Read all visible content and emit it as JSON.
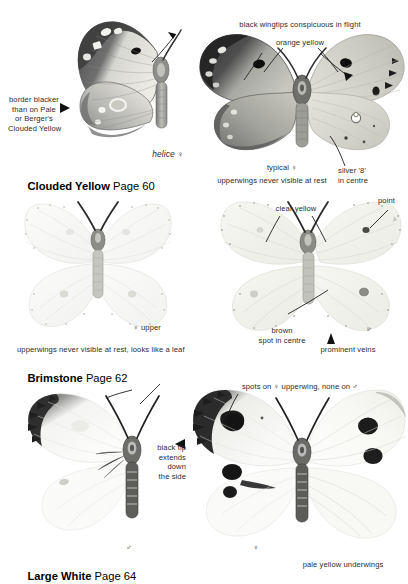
{
  "page": {
    "width": 408,
    "height": 584,
    "background": "#ffffff",
    "text_color": "#2b2b2b"
  },
  "sections": [
    {
      "id": "clouded-yellow",
      "title": "Clouded Yellow",
      "page_ref": "Page 60",
      "specimens": [
        {
          "id": "helice-female",
          "caption": "helice ♀",
          "style": "italic"
        },
        {
          "id": "typical-female",
          "caption": "typical ♀",
          "style": "normal"
        }
      ],
      "annotations": [
        {
          "id": "border-blacker",
          "text": "border blacker\nthan on Pale\nor Berger's\nClouded Yellow",
          "align": "center",
          "marker": "arrow-right"
        },
        {
          "id": "black-wingtips",
          "text": "black wingtips conspicuous in flight",
          "align": "center",
          "marker": "none"
        },
        {
          "id": "orange-yellow",
          "text": "orange yellow",
          "align": "center",
          "marker": "leader-v"
        },
        {
          "id": "upperwings-never-visible",
          "text": "upperwings never visible at rest",
          "align": "center",
          "marker": "none"
        },
        {
          "id": "silver-eight",
          "text": "silver '8'\nin centre",
          "align": "left",
          "marker": "leader-line"
        }
      ]
    },
    {
      "id": "brimstone",
      "title": "Brimstone",
      "page_ref": "Page 62",
      "specimens": [
        {
          "id": "female-upper",
          "caption": "♀ upper",
          "style": "normal"
        },
        {
          "id": "male",
          "caption": "♂",
          "style": "normal"
        }
      ],
      "annotations": [
        {
          "id": "clear-yellow",
          "text": "clear yellow",
          "align": "center",
          "marker": "leader-v"
        },
        {
          "id": "point",
          "text": "point",
          "align": "left",
          "marker": "leader-line"
        },
        {
          "id": "brown-spot",
          "text": "brown\nspot in centre",
          "align": "center",
          "marker": "leader-line"
        },
        {
          "id": "prominent-veins",
          "text": "prominent veins",
          "align": "center",
          "marker": "arrow-up"
        },
        {
          "id": "upperwings-leaf",
          "text": "upperwings never visible at rest, looks like a leaf",
          "align": "left",
          "marker": "none"
        }
      ]
    },
    {
      "id": "large-white",
      "title": "Large White",
      "page_ref": "Page 64",
      "specimens": [
        {
          "id": "male",
          "caption": "♂",
          "style": "normal"
        },
        {
          "id": "female",
          "caption": "♀",
          "style": "normal"
        }
      ],
      "annotations": [
        {
          "id": "black-tip",
          "text": "black tip\nextends\ndown\nthe side",
          "align": "right",
          "marker": "arrow-left"
        },
        {
          "id": "spots-on-female",
          "text": "spots on ♀ upperwing, none on ♂",
          "align": "center",
          "marker": "leader-line"
        },
        {
          "id": "pale-yellow-underwings",
          "text": "pale yellow underwings",
          "align": "center",
          "marker": "none"
        }
      ]
    }
  ],
  "labels": {
    "cy_border_blacker": "border blacker\nthan on Pale\nor Berger's\nClouded Yellow",
    "cy_helice": "helice ♀",
    "cy_title": "Clouded Yellow",
    "cy_page": "Page 60",
    "cy_black_wingtips": "black wingtips conspicuous in flight",
    "cy_orange_yellow": "orange yellow",
    "cy_typical": "typical ♀",
    "cy_upperwings": "upperwings never visible at rest",
    "cy_silver8": "silver '8'\nin centre",
    "br_clear_yellow": "clear yellow",
    "br_point": "point",
    "br_female_upper": "♀ upper",
    "br_brown_spot": "brown\nspot in centre",
    "br_male": "♂",
    "br_prominent_veins": "prominent veins",
    "br_upperwings_leaf": "upperwings never visible at rest, looks like a leaf",
    "br_title": "Brimstone",
    "br_page": "Page 62",
    "lw_spots": "spots on ♀ upperwing, none on ♂",
    "lw_black_tip": "black tip\nextends\ndown\nthe side",
    "lw_male": "♂",
    "lw_female": "♀",
    "lw_pale_yellow": "pale yellow underwings",
    "lw_title": "Large White",
    "lw_page": "Page 64"
  },
  "colors": {
    "ink": "#2b2b2b",
    "title": "#000000",
    "wing_dark": "#3a3a3a",
    "wing_mid": "#9a9a9a",
    "wing_pale": "#d8d8d4",
    "wing_faint": "#efefed",
    "leader": "#222222"
  }
}
